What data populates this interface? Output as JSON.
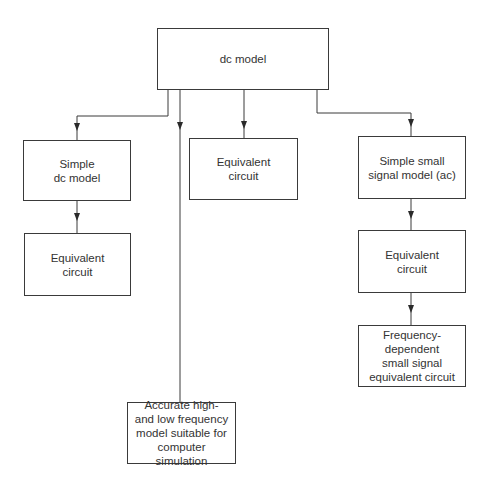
{
  "diagram": {
    "type": "flowchart-tree",
    "colors": {
      "background": "#ffffff",
      "stroke": "#3a3a3a",
      "text": "#333333"
    },
    "nodes": [
      {
        "id": "dc_model",
        "label": "dc model",
        "x": 157,
        "y": 28,
        "w": 172,
        "h": 62
      },
      {
        "id": "simple_dc_model",
        "label": "Simple\ndc model",
        "x": 23,
        "y": 140,
        "w": 108,
        "h": 61
      },
      {
        "id": "equivalent_circuit_left",
        "label": "Equivalent\ncircuit",
        "x": 24,
        "y": 233,
        "w": 107,
        "h": 63
      },
      {
        "id": "equivalent_circuit_middle",
        "label": "Equivalent\ncircuit",
        "x": 189,
        "y": 138,
        "w": 109,
        "h": 62
      },
      {
        "id": "simple_small_signal_model",
        "label": "Simple small\nsignal model (ac)",
        "x": 358,
        "y": 136,
        "w": 108,
        "h": 63
      },
      {
        "id": "equivalent_circuit_right",
        "label": "Equivalent\ncircuit",
        "x": 358,
        "y": 230,
        "w": 108,
        "h": 63
      },
      {
        "id": "frequency_dependent",
        "label": "Frequency-\ndependent\nsmall signal\nequivalent circuit",
        "x": 358,
        "y": 325,
        "w": 108,
        "h": 62
      },
      {
        "id": "accurate_model",
        "label": "Accurate high-\nand low frequency\nmodel suitable for\ncomputer simulation",
        "x": 127,
        "y": 402,
        "w": 109,
        "h": 62
      }
    ],
    "edges": [
      {
        "from": "dc_model",
        "to": "simple_dc_model",
        "path": "M168,90 L168,116 L77,116 L77,140",
        "arrow_at": [
          77,
          131
        ]
      },
      {
        "from": "dc_model",
        "to": "accurate_model",
        "path": "M180,90 L180,402",
        "arrow_at": [
          180,
          130
        ]
      },
      {
        "from": "dc_model",
        "to": "equivalent_circuit_middle",
        "path": "M244,90 L244,138",
        "arrow_at": [
          244,
          129
        ]
      },
      {
        "from": "dc_model",
        "to": "simple_small_signal_model",
        "path": "M317,90 L317,113 L411,113 L411,136",
        "arrow_at": [
          411,
          127
        ]
      },
      {
        "from": "simple_dc_model",
        "to": "equivalent_circuit_left",
        "path": "M77,201 L77,233",
        "arrow_at": [
          77,
          221
        ]
      },
      {
        "from": "simple_small_signal_model",
        "to": "equivalent_circuit_right",
        "path": "M411,199 L411,230",
        "arrow_at": [
          411,
          219
        ]
      },
      {
        "from": "equivalent_circuit_right",
        "to": "frequency_dependent",
        "path": "M411,293 L411,325",
        "arrow_at": [
          411,
          313
        ]
      }
    ]
  }
}
